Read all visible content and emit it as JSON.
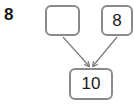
{
  "question": {
    "number": "8"
  },
  "number_bond": {
    "parts": [
      {
        "value": ""
      },
      {
        "value": "8"
      }
    ],
    "whole": {
      "value": "10"
    }
  },
  "colors": {
    "box_border": "#8a8a8a",
    "arrow": "#7a7a7a",
    "text": "#1a1a1a"
  }
}
